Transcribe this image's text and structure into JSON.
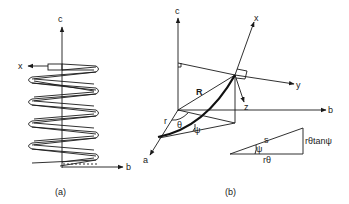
{
  "figure": {
    "panel_a": {
      "caption": "(a)",
      "axes": {
        "c": "c",
        "x": "x",
        "b": "b"
      },
      "description": "helical coil wound around vertical c axis"
    },
    "panel_b": {
      "caption": "(b)",
      "axes": {
        "c": "c",
        "b": "b",
        "a": "a",
        "x": "x",
        "y": "y",
        "z": "z"
      },
      "labels": {
        "R": "R",
        "r": "r",
        "theta": "θ",
        "psi": "ψ"
      },
      "triangle": {
        "hypotenuse": "s",
        "angle": "ψ",
        "base": "rθ",
        "height": "rθtanψ"
      }
    }
  },
  "colors": {
    "ink": "#1a1a1a",
    "background": "#ffffff"
  }
}
